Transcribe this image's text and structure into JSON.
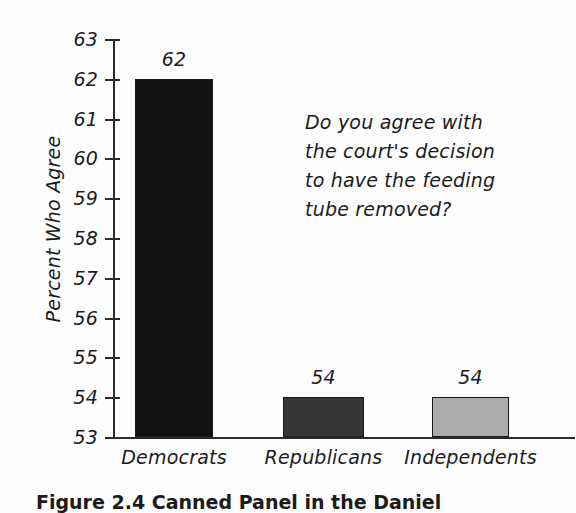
{
  "chart_data": {
    "type": "bar",
    "title": "",
    "xlabel": "",
    "ylabel": "Percent Who Agree",
    "categories": [
      "Democrats",
      "Republicans",
      "Independents"
    ],
    "values": [
      62,
      54,
      54
    ],
    "value_labels": [
      "62",
      "54",
      "54"
    ],
    "bar_colors": [
      "#121212",
      "#363636",
      "#ababab"
    ],
    "ylim": [
      53,
      63
    ],
    "yticks": [
      63,
      62,
      61,
      60,
      59,
      58,
      57,
      56,
      55,
      54,
      53
    ],
    "ytick_labels": [
      "63",
      "62",
      "61",
      "60",
      "59",
      "58",
      "57",
      "56",
      "55",
      "54",
      "53"
    ],
    "grid": false,
    "legend": "none",
    "annotation": {
      "lines": [
        "Do you agree with",
        "the court's decision",
        "to have the feeding",
        "tube removed?"
      ]
    }
  },
  "figure": {
    "caption": "Figure 2.4  Canned Panel in the Daniel"
  }
}
